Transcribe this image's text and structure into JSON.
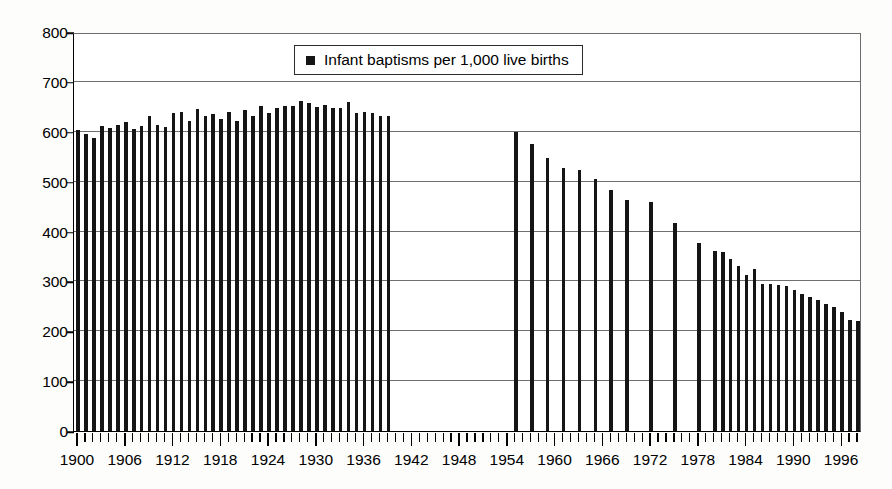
{
  "chart_data": {
    "type": "bar",
    "title": "",
    "subtitle": "",
    "xlabel": "",
    "ylabel": "",
    "xlim": [
      1899.5,
      1998.5
    ],
    "ylim": [
      0,
      800
    ],
    "ytick_step": 100,
    "yticks": [
      0,
      100,
      200,
      300,
      400,
      500,
      600,
      700,
      800
    ],
    "ytick_labels": [
      "0",
      "100",
      "200",
      "300",
      "400",
      "500",
      "600",
      "700",
      "800"
    ],
    "xticks": [
      1900,
      1906,
      1912,
      1918,
      1924,
      1930,
      1936,
      1942,
      1948,
      1954,
      1960,
      1966,
      1972,
      1978,
      1984,
      1990,
      1996
    ],
    "xtick_labels": [
      "1900",
      "1906",
      "1912",
      "1918",
      "1924",
      "1930",
      "1936",
      "1942",
      "1948",
      "1954",
      "1960",
      "1966",
      "1972",
      "1978",
      "1984",
      "1990",
      "1996"
    ],
    "xtick_minor_step": 1,
    "grid": true,
    "grid_axis": "y",
    "legend_position": "top-center",
    "legend": [
      "Infant baptisms per 1,000 live births"
    ],
    "bar_color": "#151515",
    "grid_color": "#707070",
    "axis_color": "#000000",
    "missing_note": "No data plotted for 1940-1954; data plotted only every 2-3 years between 1955 and 1979",
    "series": [
      {
        "name": "Infant baptisms per 1,000 live births",
        "points": [
          [
            1900,
            604
          ],
          [
            1901,
            596
          ],
          [
            1902,
            588
          ],
          [
            1903,
            611
          ],
          [
            1904,
            608
          ],
          [
            1905,
            614
          ],
          [
            1906,
            620
          ],
          [
            1907,
            606
          ],
          [
            1908,
            612
          ],
          [
            1909,
            632
          ],
          [
            1910,
            614
          ],
          [
            1911,
            610
          ],
          [
            1912,
            637
          ],
          [
            1913,
            639
          ],
          [
            1914,
            622
          ],
          [
            1915,
            645
          ],
          [
            1916,
            632
          ],
          [
            1917,
            636
          ],
          [
            1918,
            626
          ],
          [
            1919,
            639
          ],
          [
            1920,
            622
          ],
          [
            1921,
            644
          ],
          [
            1922,
            632
          ],
          [
            1923,
            651
          ],
          [
            1924,
            638
          ],
          [
            1925,
            648
          ],
          [
            1926,
            651
          ],
          [
            1927,
            652
          ],
          [
            1928,
            662
          ],
          [
            1929,
            657
          ],
          [
            1930,
            649
          ],
          [
            1931,
            653
          ],
          [
            1932,
            648
          ],
          [
            1933,
            648
          ],
          [
            1934,
            660
          ],
          [
            1935,
            637
          ],
          [
            1936,
            639
          ],
          [
            1937,
            638
          ],
          [
            1938,
            632
          ],
          [
            1939,
            631
          ],
          [
            1955,
            599
          ],
          [
            1957,
            575
          ],
          [
            1959,
            548
          ],
          [
            1961,
            528
          ],
          [
            1963,
            524
          ],
          [
            1965,
            505
          ],
          [
            1967,
            483
          ],
          [
            1969,
            463
          ],
          [
            1972,
            459
          ],
          [
            1975,
            418
          ],
          [
            1978,
            377
          ],
          [
            1980,
            360
          ],
          [
            1981,
            359
          ],
          [
            1982,
            344
          ],
          [
            1983,
            330
          ],
          [
            1984,
            312
          ],
          [
            1985,
            325
          ],
          [
            1986,
            295
          ],
          [
            1987,
            294
          ],
          [
            1988,
            293
          ],
          [
            1989,
            291
          ],
          [
            1990,
            283
          ],
          [
            1991,
            275
          ],
          [
            1992,
            268
          ],
          [
            1993,
            262
          ],
          [
            1994,
            255
          ],
          [
            1995,
            248
          ],
          [
            1996,
            239
          ],
          [
            1997,
            222
          ],
          [
            1998,
            221
          ]
        ]
      }
    ]
  },
  "legend": {
    "swatch_name": "legend-color-swatch",
    "label": "Infant baptisms per 1,000 live births"
  }
}
